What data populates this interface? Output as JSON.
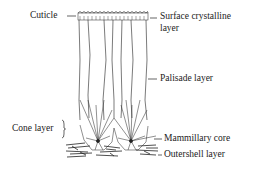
{
  "figure": {
    "labels": {
      "cuticle": "Cuticle",
      "surface_crystalline_line1": "Surface crystalline",
      "surface_crystalline_line2": "layer",
      "palisade": "Palisade layer",
      "cone": "Cone layer",
      "mammillary_core": "Mammillary core",
      "outershell": "Outershell layer"
    },
    "colors": {
      "ink": "#222222",
      "background": "#ffffff"
    }
  }
}
